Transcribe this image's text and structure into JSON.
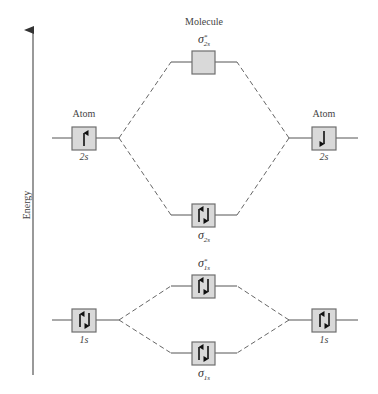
{
  "diagram": {
    "title": "Molecule",
    "axis_label": "Energy",
    "colors": {
      "box_fill": "#d9d9d9",
      "box_border": "#6e6e6e",
      "line": "#555555",
      "text": "#444444"
    },
    "left_atom": {
      "header": "Atom",
      "orbitals": [
        {
          "label": "2s",
          "electrons": "up"
        },
        {
          "label": "1s",
          "electrons": "up-down"
        }
      ]
    },
    "right_atom": {
      "header": "Atom",
      "orbitals": [
        {
          "label": "2s",
          "electrons": "down"
        },
        {
          "label": "1s",
          "electrons": "up-down"
        }
      ]
    },
    "molecular_orbitals": [
      {
        "symbol": "σ",
        "subscript": "2s",
        "star": "*",
        "name": "sigma-star-2s",
        "electrons": "empty"
      },
      {
        "symbol": "σ",
        "subscript": "2s",
        "star": "",
        "name": "sigma-2s",
        "electrons": "up-down"
      },
      {
        "symbol": "σ",
        "subscript": "1s",
        "star": "*",
        "name": "sigma-star-1s",
        "electrons": "up-down"
      },
      {
        "symbol": "σ",
        "subscript": "1s",
        "star": "",
        "name": "sigma-1s",
        "electrons": "up-down"
      }
    ]
  }
}
